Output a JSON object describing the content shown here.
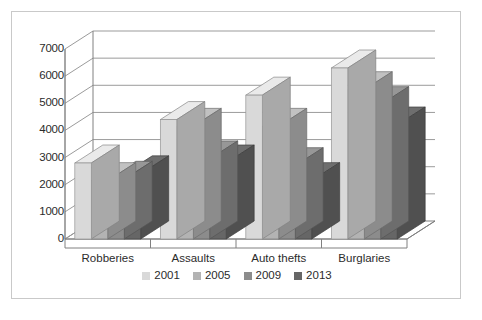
{
  "chart_data": {
    "type": "bar",
    "title": "",
    "subtitle": "",
    "xlabel": "",
    "ylabel": "",
    "categories": [
      "Robberies",
      "Assaults",
      "Auto thefts",
      "Burglaries"
    ],
    "series": [
      {
        "name": "2001",
        "values": [
          2800,
          4400,
          5300,
          6300
        ],
        "color": "#d9d9d9"
      },
      {
        "name": "2005",
        "values": [
          2150,
          4150,
          4150,
          5500
        ],
        "color": "#b3b3b3"
      },
      {
        "name": "2009",
        "values": [
          2200,
          2950,
          2700,
          4950
        ],
        "color": "#8c8c8c"
      },
      {
        "name": "2013",
        "values": [
          2400,
          2800,
          2150,
          4200
        ],
        "color": "#666666"
      }
    ],
    "ylim": [
      0,
      7000
    ],
    "y_ticks": [
      0,
      1000,
      2000,
      3000,
      4000,
      5000,
      6000,
      7000
    ],
    "y_tick_labels": [
      "0",
      "1000",
      "2000",
      "3000",
      "4000",
      "5000",
      "6000",
      "7000"
    ],
    "grid": true,
    "grid_axis": "y",
    "legend": true,
    "legend_position": "bottom",
    "style": "3d-clustered-column",
    "frame_color": "#c9c9c9",
    "axis_color": "#808080",
    "grid_color": "#9b9b9b",
    "text_color": "#2b2b2b",
    "background": "#ffffff"
  },
  "legend": {
    "entries": [
      {
        "label": "2001",
        "color": "#d9d9d9"
      },
      {
        "label": "2005",
        "color": "#b3b3b3"
      },
      {
        "label": "2009",
        "color": "#8c8c8c"
      },
      {
        "label": "2013",
        "color": "#666666"
      }
    ]
  }
}
